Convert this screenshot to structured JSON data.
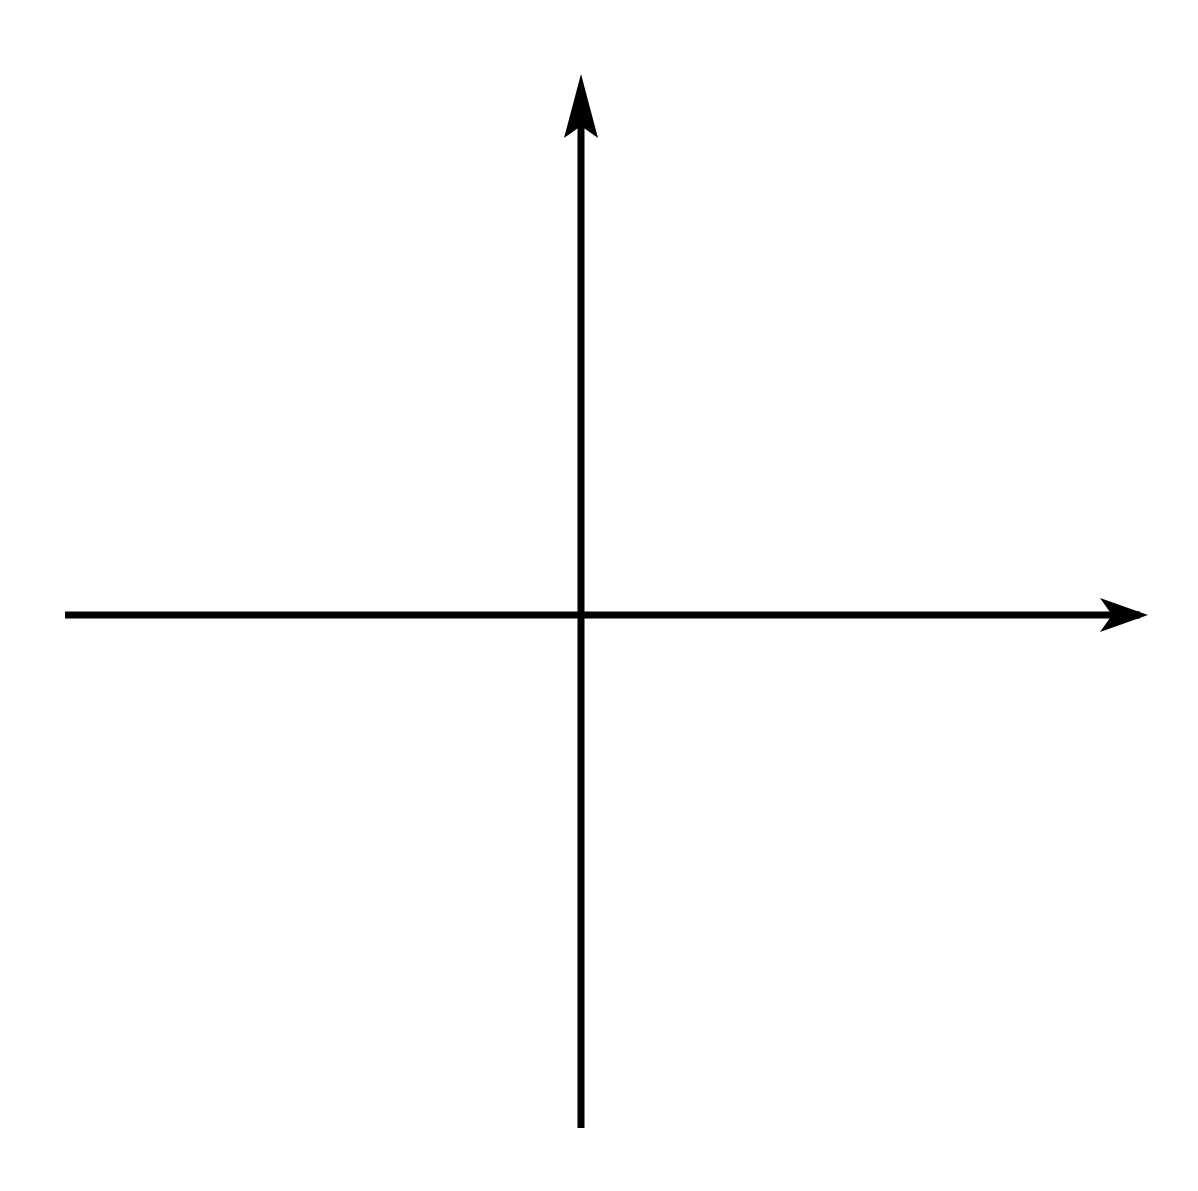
{
  "figure": {
    "kind": "cartesian-coordinate-grid",
    "background_color": "#ffffff",
    "ink_color": "#000000",
    "axis_x_label": "x",
    "axis_y_label": "y"
  },
  "chart_data": {
    "type": "scatter",
    "title": "",
    "subtitle": "",
    "xlabel": "x",
    "ylabel": "y",
    "series": [
      {
        "name": "plotted-points",
        "x": [],
        "y": []
      }
    ],
    "x": [],
    "values": [],
    "categories": [],
    "xlim": [
      -7.0,
      7.1
    ],
    "ylim": [
      -6.75,
      6.9
    ],
    "xticks": [
      -6,
      -5,
      -4,
      -3,
      -2,
      -1,
      1,
      2,
      3,
      4,
      5,
      6
    ],
    "yticks": [
      6,
      5,
      4,
      3,
      2,
      1,
      -1,
      -2,
      -3,
      -4,
      -5,
      -6
    ],
    "xtick_labels": [
      "–6",
      "–5",
      "–4",
      "–3",
      "–2",
      "–1",
      "1",
      "2",
      "3",
      "4",
      "5",
      "6"
    ],
    "ytick_labels": [
      "6",
      "5",
      "4",
      "3",
      "2",
      "1",
      "–1",
      "–2",
      "–3",
      "–4",
      "–5",
      "–6"
    ],
    "grid": true,
    "grid_style": "dotted",
    "grid_step": 1,
    "legend": null,
    "legend_position": "none",
    "annotations": [],
    "axis_arrows": {
      "x_positive": true,
      "y_positive": true
    }
  },
  "xticks": [
    {
      "value": -6,
      "label": "–6"
    },
    {
      "value": -5,
      "label": "–5"
    },
    {
      "value": -4,
      "label": "–4"
    },
    {
      "value": -3,
      "label": "–3"
    },
    {
      "value": -2,
      "label": "–2"
    },
    {
      "value": -1,
      "label": "–1"
    },
    {
      "value": 1,
      "label": "1"
    },
    {
      "value": 2,
      "label": "2"
    },
    {
      "value": 3,
      "label": "3"
    },
    {
      "value": 4,
      "label": "4"
    },
    {
      "value": 5,
      "label": "5"
    },
    {
      "value": 6,
      "label": "6"
    }
  ],
  "yticks": [
    {
      "value": 6,
      "label": "6"
    },
    {
      "value": 5,
      "label": "5"
    },
    {
      "value": 4,
      "label": "4"
    },
    {
      "value": 3,
      "label": "3"
    },
    {
      "value": 2,
      "label": "2"
    },
    {
      "value": 1,
      "label": "1"
    },
    {
      "value": -1,
      "label": "–1"
    },
    {
      "value": -2,
      "label": "–2"
    },
    {
      "value": -3,
      "label": "–3"
    },
    {
      "value": -4,
      "label": "–4"
    },
    {
      "value": -5,
      "label": "–5"
    },
    {
      "value": -6,
      "label": "–6"
    }
  ]
}
